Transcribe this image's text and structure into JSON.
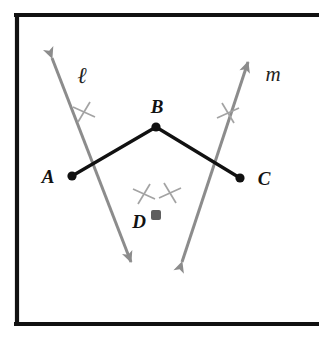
{
  "figure": {
    "name": "perpendicular-bisector-construction",
    "background_color": "#ffffff",
    "frame": {
      "color": "#111111",
      "stroke_width": 4,
      "x": 16,
      "y": 14,
      "width": 318,
      "height": 311,
      "right_edge_visible": false
    },
    "colors": {
      "segment": "#111111",
      "construction_line": "#8c8c8c",
      "point_fill": "#111111",
      "point_fill_gray": "#5f5f5f",
      "label": "#232323"
    },
    "points": [
      {
        "id": "A",
        "label": "A",
        "x": 72,
        "y": 176,
        "dot_r": 4.5,
        "dot_color": "#111111",
        "label_x": 48,
        "label_y": 182,
        "label_anchor": "middle"
      },
      {
        "id": "B",
        "label": "B",
        "x": 156,
        "y": 127,
        "dot_r": 4.5,
        "dot_color": "#111111",
        "label_x": 157,
        "label_y": 113,
        "label_anchor": "middle"
      },
      {
        "id": "C",
        "label": "C",
        "x": 240,
        "y": 178,
        "dot_r": 4.5,
        "dot_color": "#111111",
        "label_x": 263,
        "label_y": 184,
        "label_anchor": "middle"
      },
      {
        "id": "D",
        "label": "D",
        "x": 156,
        "y": 215,
        "dot_r": 5.0,
        "dot_color": "#5f5f5f",
        "label_x": 139,
        "label_y": 227,
        "label_anchor": "middle"
      }
    ],
    "segments": [
      {
        "id": "AB",
        "from": "A",
        "to": "B",
        "x1": 72,
        "y1": 176,
        "x2": 156,
        "y2": 127,
        "color": "#111111",
        "width": 3.2
      },
      {
        "id": "BC",
        "from": "B",
        "to": "C",
        "x1": 156,
        "y1": 127,
        "x2": 240,
        "y2": 178,
        "color": "#111111",
        "width": 3.2
      }
    ],
    "construction_lines": [
      {
        "id": "l",
        "label": "ℓ",
        "label_x": 82,
        "label_y": 82,
        "x1": 52,
        "y1": 58,
        "x2": 131,
        "y2": 262,
        "color": "#8c8c8c",
        "width": 3.0,
        "arrow_start": true,
        "arrow_end": true,
        "ticks": [
          {
            "x": 84,
            "y": 112
          },
          {
            "x": 144,
            "y": 194
          }
        ]
      },
      {
        "id": "m",
        "label": "m",
        "label_x": 272,
        "label_y": 80,
        "x1": 182,
        "y1": 262,
        "x2": 248,
        "y2": 62,
        "color": "#8c8c8c",
        "width": 3.0,
        "arrow_start": true,
        "arrow_end": true,
        "ticks": [
          {
            "x": 228,
            "y": 113
          },
          {
            "x": 170,
            "y": 193
          }
        ]
      }
    ],
    "tick_mark": {
      "style": "x-cross",
      "arm_length": 11,
      "color": "#a0a0a0",
      "width": 1.6
    }
  }
}
